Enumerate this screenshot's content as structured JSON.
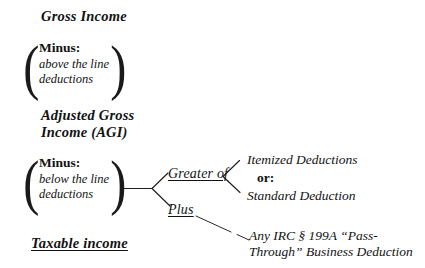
{
  "diagram": {
    "type": "tax-computation-flowchart",
    "background_color": "#ffffff",
    "text_color": "#121212"
  },
  "nodes": {
    "gross_income": "Gross Income",
    "minus_above": {
      "label": "Minus:",
      "detail_line1": "above the line",
      "detail_line2": "deductions"
    },
    "agi": {
      "line1": "Adjusted Gross",
      "line2": "Income (AGI)"
    },
    "minus_below": {
      "label": "Minus:",
      "detail_line1": "below the line",
      "detail_line2": "deductions"
    },
    "greater_of": "Greater of",
    "plus": "Plus",
    "itemized_deductions": "Itemized Deductions",
    "or_connector": "or:",
    "standard_deduction": "Standard Deduction",
    "pass_through": {
      "line1": "Any IRC § 199A “Pass-",
      "line2": "Through” Business Deduction"
    },
    "taxable_income": "Taxable income"
  },
  "brackets": {
    "open_paren": "(",
    "close_paren": ")"
  }
}
